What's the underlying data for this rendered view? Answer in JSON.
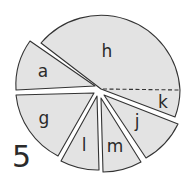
{
  "figure": {
    "number": "5",
    "fill_color": "#e3e3e3",
    "stroke_color": "#333333",
    "segments": [
      {
        "id": "h",
        "label": "h"
      },
      {
        "id": "k",
        "label": "k"
      },
      {
        "id": "a",
        "label": "a"
      },
      {
        "id": "g",
        "label": "g"
      },
      {
        "id": "l",
        "label": "l"
      },
      {
        "id": "m",
        "label": "m"
      },
      {
        "id": "j",
        "label": "j"
      }
    ]
  }
}
